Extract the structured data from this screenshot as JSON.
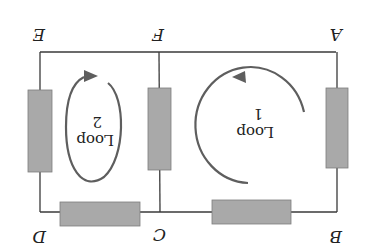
{
  "diagram": {
    "orientation": "rotated 180 degrees",
    "nodes": {
      "A": "A",
      "B": "B",
      "C": "C",
      "D": "D",
      "E": "E",
      "F": "F"
    },
    "loops": [
      {
        "label": "Loop",
        "number": "1"
      },
      {
        "label": "Loop",
        "number": "2"
      }
    ],
    "colors": {
      "wire": "#3a3a3a",
      "resistor_fill": "#a9a9a9",
      "resistor_stroke": "#7d7d7d",
      "loop_arrow": "#5e5e5e"
    },
    "resistors": [
      {
        "name": "resistor-AB"
      },
      {
        "name": "resistor-BC"
      },
      {
        "name": "resistor-CD"
      },
      {
        "name": "resistor-DE"
      },
      {
        "name": "resistor-CF"
      }
    ]
  }
}
